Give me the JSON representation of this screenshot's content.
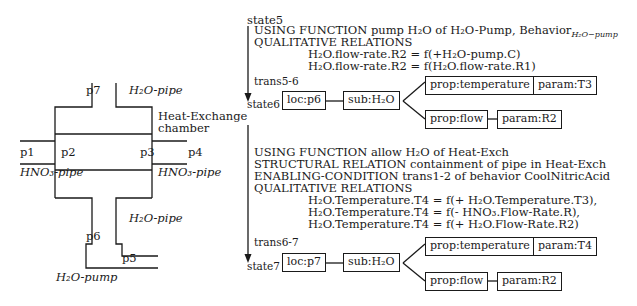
{
  "left_diagram": {
    "labels": {
      "p7": "p7",
      "h2o_pipe_top": "H₂O-pipe",
      "chamber_line1": "Heat-Exchange",
      "chamber_line2": "chamber",
      "p1": "p1",
      "p2": "p2",
      "p3": "p3",
      "p4": "p4",
      "hno3_pipe_left": "HNO₃-pipe",
      "hno3_pipe_right": "HNO₃-pipe",
      "h2o_pipe_bottom": "H₂O-pipe",
      "p6": "p6",
      "p5": "p5",
      "h2o_pump": "H₂O-pump"
    }
  },
  "sequence": {
    "state5": {
      "label": "state5",
      "lines": [
        "USING FUNCTION pump H₂O of H₂O-Pump, Behavior",
        "QUALITATIVE RELATIONS"
      ],
      "behavior_subscript": "H₂O−pump",
      "relations": [
        "H₂O.flow-rate.R2 = f(+H₂O-pump.C)",
        "H₂O.flow-rate.R2 = f(H₂O.flow-rate.R1)"
      ]
    },
    "trans56": {
      "label": "trans5-6"
    },
    "state6": {
      "label": "state6",
      "loc": "loc:p6",
      "sub": "sub:H₂O",
      "prop_temp": "prop:temperature",
      "param_temp": "param:T3",
      "prop_flow": "prop:flow",
      "param_flow": "param:R2"
    },
    "block2": {
      "lines": [
        "USING FUNCTION allow H₂O of Heat-Exch",
        "STRUCTURAL RELATION containment of pipe in Heat-Exch",
        "ENABLING-CONDITION trans1-2 of behavior CoolNitricAcid",
        "QUALITATIVE RELATIONS"
      ],
      "relations": [
        "H₂O.Temperature.T4 = f(+ H₂O.Temperature.T3),",
        "H₂O.Temperature.T4 = f(- HNO₃.Flow-Rate.R),",
        "H₂O.Temperature.T4 = f(+ H₂O.Flow-Rate.R2)"
      ]
    },
    "trans67": {
      "label": "trans6-7"
    },
    "state7": {
      "label": "state7",
      "loc": "loc:p7",
      "sub": "sub:H₂O",
      "prop_temp": "prop:temperature",
      "param_temp": "param:T4",
      "prop_flow": "prop:flow",
      "param_flow": "param:R2"
    }
  }
}
